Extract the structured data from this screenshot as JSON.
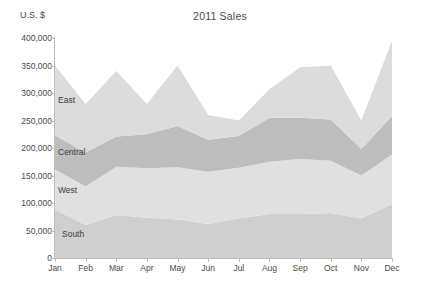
{
  "chart_data": {
    "type": "area",
    "stacked": true,
    "title": "2011 Sales",
    "xlabel": "",
    "ylabel": "U.S. $",
    "categories": [
      "Jan",
      "Feb",
      "Mar",
      "Apr",
      "May",
      "Jun",
      "Jul",
      "Aug",
      "Sep",
      "Oct",
      "Nov",
      "Dec"
    ],
    "ylim": [
      0,
      400000
    ],
    "ytick_values": [
      0,
      50000,
      100000,
      150000,
      200000,
      250000,
      300000,
      350000,
      400000
    ],
    "ytick_labels": [
      "0",
      "50,000",
      "100,000",
      "150,000",
      "200,000",
      "250,000",
      "300,000",
      "350,000",
      "400,000"
    ],
    "grid": false,
    "legend_position": "inline-labels",
    "series": [
      {
        "name": "South",
        "color": "#cfcfcf",
        "label_x_index": 0,
        "values": [
          88000,
          60000,
          78000,
          73000,
          70000,
          62000,
          72000,
          80000,
          80000,
          82000,
          72000,
          98000
        ]
      },
      {
        "name": "West",
        "color": "#e0e0e0",
        "label_x_index": 0,
        "values": [
          73000,
          70000,
          88000,
          90000,
          95000,
          95000,
          92000,
          95000,
          100000,
          95000,
          78000,
          90000
        ]
      },
      {
        "name": "Central",
        "color": "#bdbdbd",
        "label_x_index": 0,
        "values": [
          62000,
          62000,
          55000,
          62000,
          75000,
          58000,
          58000,
          80000,
          75000,
          75000,
          48000,
          70000
        ]
      },
      {
        "name": "East",
        "color": "#dcdcdc",
        "label_x_index": 0,
        "values": [
          127000,
          88000,
          119000,
          55000,
          110000,
          45000,
          28000,
          52000,
          92000,
          98000,
          52000,
          137000
        ]
      }
    ],
    "totals": [
      350000,
      280000,
      340000,
      280000,
      350000,
      260000,
      250000,
      307000,
      347000,
      350000,
      250000,
      395000
    ]
  },
  "axis_colors": {
    "line": "#bdbdbd",
    "text": "#4a4a4a"
  }
}
